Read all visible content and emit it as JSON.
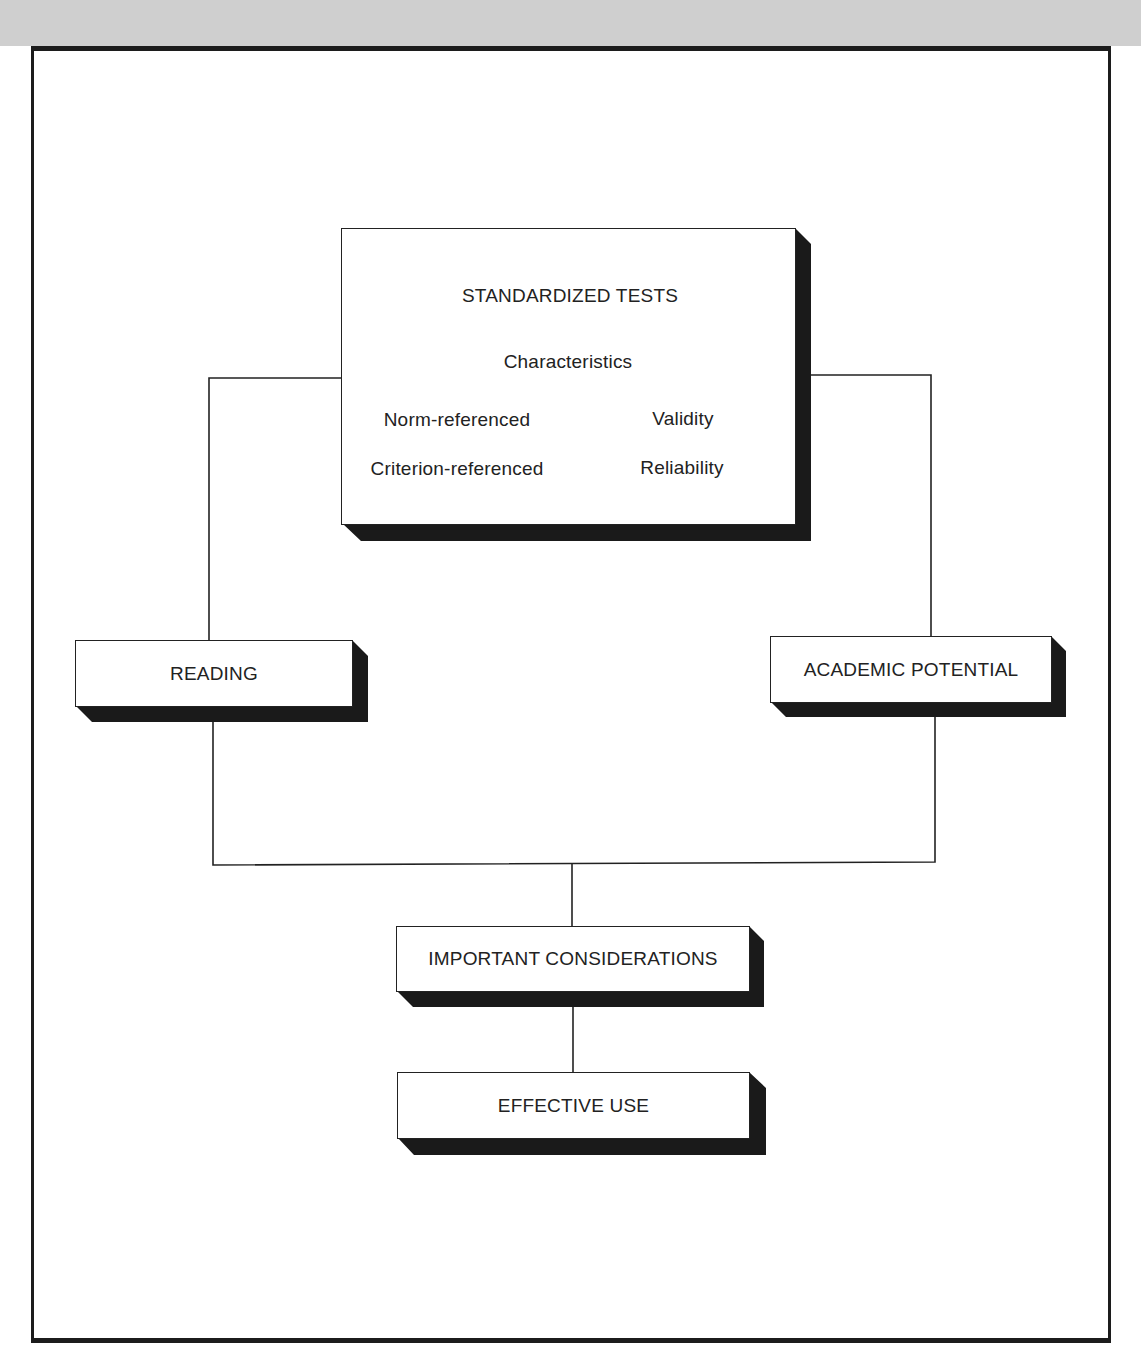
{
  "diagram": {
    "main": {
      "title": "STANDARDIZED TESTS",
      "subtitle": "Characteristics",
      "left_items": [
        "Norm-referenced",
        "Criterion-referenced"
      ],
      "right_items": [
        "Validity",
        "Reliability"
      ]
    },
    "left_node": {
      "label": "READING"
    },
    "right_node": {
      "label": "ACADEMIC POTENTIAL"
    },
    "considerations_node": {
      "label": "IMPORTANT CONSIDERATIONS"
    },
    "effective_use_node": {
      "label": "EFFECTIVE USE"
    },
    "colors": {
      "band": "#cfcfcf",
      "line": "#222222",
      "shadow": "#1a1a1a",
      "box_fill": "#ffffff"
    }
  }
}
